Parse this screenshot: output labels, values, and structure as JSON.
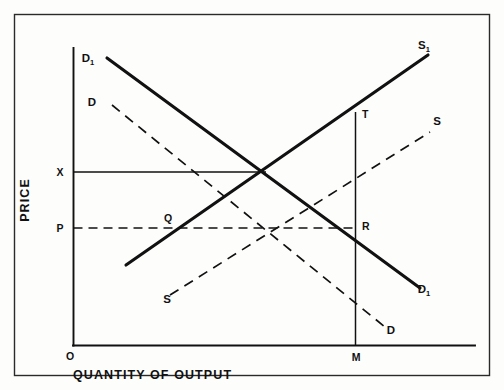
{
  "figure": {
    "background_color": "#fdfdfc",
    "ink_color": "#111111",
    "frame": {
      "x": 14,
      "y": 14,
      "width": 476,
      "height": 362
    }
  },
  "axes": {
    "y_axis_title": "PRICE",
    "x_axis_title": "QUANTITY OF OUTPUT",
    "origin_label": "O",
    "price_level_high_label": "X",
    "price_level_low_label": "P",
    "quantity_marker_label": "M"
  },
  "curves": [
    {
      "name": "demand-shifted",
      "label": "D",
      "subscript": "1",
      "style": "solid",
      "label_start_x": 90,
      "label_start_y": 62,
      "label_end_x": 424,
      "label_end_y": 292,
      "x1": 107,
      "y1": 58,
      "x2": 420,
      "y2": 288
    },
    {
      "name": "demand-original",
      "label": "D",
      "subscript": "",
      "style": "dashed",
      "label_start_x": 92,
      "label_start_y": 104,
      "label_end_x": 389,
      "label_end_y": 332,
      "x1": 112,
      "y1": 105,
      "x2": 385,
      "y2": 327
    },
    {
      "name": "supply-shifted",
      "label": "S",
      "subscript": "1",
      "style": "solid",
      "label_start_x": 0,
      "label_start_y": 0,
      "label_end_x": 418,
      "label_end_y": 50,
      "x1": 126,
      "y1": 265,
      "x2": 428,
      "y2": 55
    },
    {
      "name": "supply-original",
      "label": "S",
      "subscript": "",
      "style": "dashed",
      "label_start_x": 165,
      "label_start_y": 302,
      "label_end_x": 434,
      "label_end_y": 124,
      "x1": 170,
      "y1": 295,
      "x2": 430,
      "y2": 132
    }
  ],
  "chart_data": {
    "type": "line",
    "title": "",
    "xlabel": "QUANTITY OF OUTPUT",
    "ylabel": "PRICE",
    "grid": false,
    "legend": "inline-curve-labels",
    "axis_origin": {
      "label": "O",
      "x_px": 73,
      "y_px": 345
    },
    "axis_ranges": {
      "x_px": [
        73,
        475
      ],
      "y_px": [
        48,
        345
      ]
    },
    "price_levels": [
      {
        "label": "X",
        "y_px": 172,
        "line_style": "solid",
        "extends_to_x_px": 265
      },
      {
        "label": "P",
        "y_px": 228,
        "line_style": "dashed",
        "extends_to_x_px": 355
      }
    ],
    "quantity_markers": [
      {
        "label": "M",
        "x_px": 355,
        "vertical_line_from_y_px": 345,
        "vertical_line_to_y_px": 112
      }
    ],
    "series": [
      {
        "name": "D1",
        "display_label": "D1",
        "style": "solid",
        "slope": "downward",
        "points_px": [
          [
            107,
            58
          ],
          [
            420,
            288
          ]
        ]
      },
      {
        "name": "D",
        "display_label": "D",
        "style": "dashed",
        "slope": "downward",
        "points_px": [
          [
            112,
            105
          ],
          [
            385,
            327
          ]
        ]
      },
      {
        "name": "S1",
        "display_label": "S1",
        "style": "solid",
        "slope": "upward",
        "points_px": [
          [
            126,
            265
          ],
          [
            428,
            55
          ]
        ]
      },
      {
        "name": "S",
        "display_label": "S",
        "style": "dashed",
        "slope": "upward",
        "points_px": [
          [
            170,
            295
          ],
          [
            430,
            132
          ]
        ]
      }
    ],
    "annotated_points": [
      {
        "label": "Q",
        "x_px": 173,
        "y_px": 228,
        "description": "S1 intersects price level P"
      },
      {
        "label": "T",
        "x_px": 355,
        "y_px": 112,
        "description": "S1 at quantity M"
      },
      {
        "label": "R",
        "x_px": 355,
        "y_px": 228,
        "description": "D1 at price level P and quantity M"
      },
      {
        "label": "E",
        "x_px": 265,
        "y_px": 172,
        "description": "D1 intersects S1 at price level X"
      },
      {
        "label": "E0",
        "x_px": 272,
        "y_px": 228,
        "description": "D intersects S at price level P"
      }
    ]
  },
  "point_labels": [
    {
      "name": "point-label-q",
      "text": "Q",
      "x": 168,
      "y": 222
    },
    {
      "name": "point-label-t",
      "text": "T",
      "x": 361,
      "y": 117
    },
    {
      "name": "point-label-r",
      "text": "R",
      "x": 361,
      "y": 229
    }
  ],
  "axis_marks": {
    "origin": {
      "text": "O",
      "x": 66,
      "y": 360
    },
    "x_label": {
      "text": "QUANTITY OF OUTPUT",
      "x": 73,
      "y": 378
    },
    "y_label": {
      "text": "PRICE",
      "cx": 29,
      "cy": 200
    },
    "tick_x": {
      "text": "X",
      "x": 55,
      "y": 176
    },
    "tick_p": {
      "text": "P",
      "x": 56,
      "y": 232
    },
    "tick_m": {
      "text": "M",
      "x": 350,
      "y": 360
    }
  }
}
